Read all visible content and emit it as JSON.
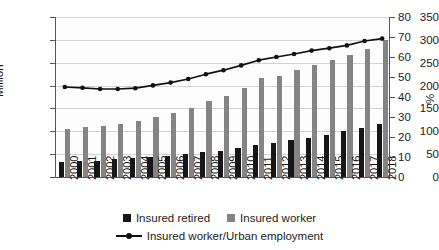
{
  "chart_data": {
    "type": "bar",
    "title": "",
    "subtitle": "",
    "xlabel": "",
    "ylabel": "Million",
    "ylabel_secondary": "%",
    "ylim": [
      0,
      350
    ],
    "ylim_secondary": [
      0,
      80
    ],
    "yticks": [
      0,
      50,
      100,
      150,
      200,
      250,
      300,
      350
    ],
    "yticks_secondary": [
      0,
      10,
      20,
      30,
      40,
      50,
      60,
      70,
      80
    ],
    "grid": true,
    "legend_position": "bottom",
    "categories": [
      "2000",
      "2001",
      "2002",
      "2003",
      "2004",
      "2005",
      "2006",
      "2007",
      "2008",
      "2009",
      "2010",
      "2011",
      "2012",
      "2013",
      "2014",
      "2015",
      "2016",
      "2017",
      "2018"
    ],
    "series": [
      {
        "name": "Insured retired",
        "type": "bar",
        "axis": "left",
        "color": "#161616",
        "values": [
          32,
          34,
          36,
          39,
          41,
          44,
          47,
          50,
          54,
          58,
          63,
          69,
          74,
          80,
          85,
          91,
          101,
          107,
          115
        ]
      },
      {
        "name": "Insured worker",
        "type": "bar",
        "axis": "left",
        "color": "#848484",
        "values": [
          105,
          109,
          112,
          117,
          123,
          131,
          141,
          152,
          166,
          178,
          194,
          216,
          222,
          234,
          246,
          256,
          266,
          280,
          300
        ]
      },
      {
        "name": "Insured worker/Urban employment",
        "type": "line",
        "axis": "right",
        "color": "#111111",
        "values": [
          45.0,
          44.6,
          44.0,
          44.0,
          44.4,
          45.8,
          47.2,
          49.0,
          51.4,
          53.4,
          55.8,
          58.4,
          60.0,
          61.5,
          63.2,
          64.4,
          65.8,
          68.0,
          69.2
        ]
      }
    ]
  },
  "legend": {
    "items": [
      {
        "label": "Insured retired",
        "marker": "square-black"
      },
      {
        "label": "Insured worker",
        "marker": "square-gray"
      },
      {
        "label": "Insured worker/Urban employment",
        "marker": "line-with-dot"
      }
    ]
  }
}
